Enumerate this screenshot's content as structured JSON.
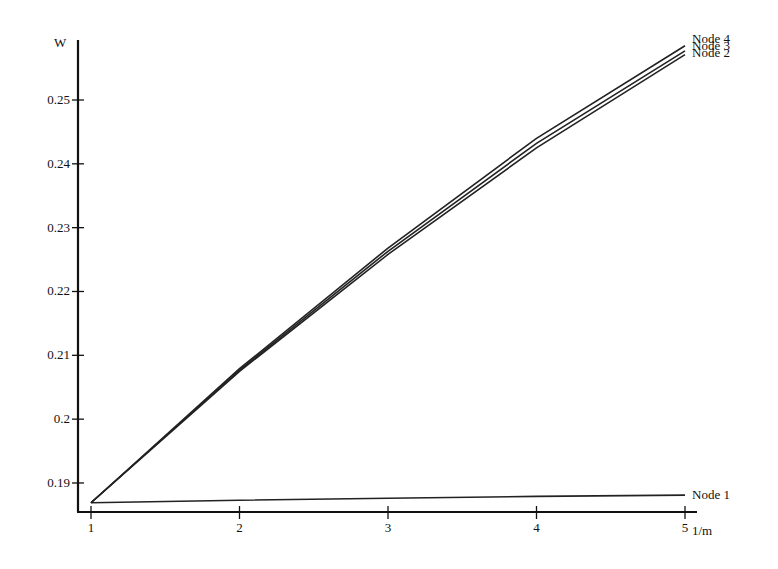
{
  "chart_data": {
    "type": "line",
    "title": "",
    "xlabel": "1/m",
    "ylabel": "W",
    "x": [
      1,
      2,
      3,
      4,
      5
    ],
    "x_ticks": [
      "1",
      "2",
      "3",
      "4",
      "5"
    ],
    "y_ticks": [
      "0.19",
      "0.2",
      "0.21",
      "0.22",
      "0.23",
      "0.24",
      "0.25"
    ],
    "y_tick_values": [
      0.19,
      0.2,
      0.21,
      0.22,
      0.23,
      0.24,
      0.25
    ],
    "xlim": [
      1,
      5
    ],
    "ylim": [
      0.1855,
      0.261
    ],
    "grid": false,
    "legend_position": "inline-right-end",
    "series": [
      {
        "name": "Node 1",
        "values": [
          0.1869,
          0.1873,
          0.1876,
          0.1879,
          0.1881
        ]
      },
      {
        "name": "Node 2",
        "values": [
          0.1869,
          0.2075,
          0.2258,
          0.2425,
          0.2571
        ]
      },
      {
        "name": "Node 3",
        "values": [
          0.1869,
          0.2077,
          0.2263,
          0.2432,
          0.2577
        ]
      },
      {
        "name": "Node 4",
        "values": [
          0.1869,
          0.2079,
          0.2268,
          0.244,
          0.2585
        ]
      }
    ]
  }
}
